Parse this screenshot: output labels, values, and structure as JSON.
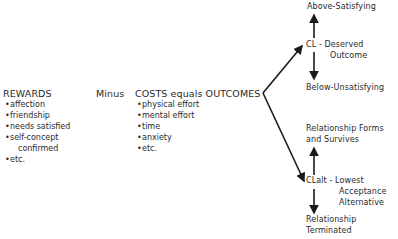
{
  "rewards": {
    "title": "REWARDS",
    "items": [
      "affection",
      "friendship",
      "needs satisfied",
      "self-concept",
      "confirmed",
      "etc."
    ]
  },
  "minus": "Minus",
  "costs": {
    "title": "COSTS equals OUTCOMES",
    "items": [
      "physical effort",
      "mental effort",
      "time",
      "anxiety",
      "etc."
    ]
  },
  "upper_branch": {
    "top": "Above-Satisfying",
    "node_line1": "CL - Deserved",
    "node_line2": "Outcome",
    "bottom": "Below-Unsatisfying"
  },
  "lower_branch": {
    "top_line1": "Relationship Forms",
    "top_line2": "and Survives",
    "node_line1": "CLalt - Lowest",
    "node_line2": "Acceptance",
    "node_line3": "Alternative",
    "bottom_line1": "Relationship",
    "bottom_line2": "Terminated"
  },
  "bullet": "•"
}
